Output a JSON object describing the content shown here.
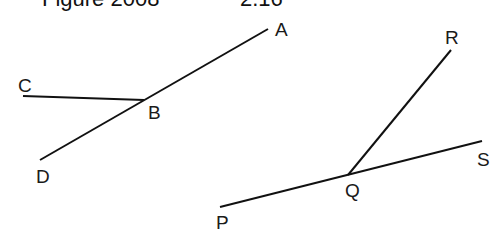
{
  "header": {
    "title_left": "Figure 2008",
    "title_right": "2.16"
  },
  "figure_left": {
    "points": {
      "A": {
        "label": "A",
        "x": 268,
        "y": 29
      },
      "B": {
        "label": "B",
        "x": 144,
        "y": 100
      },
      "C": {
        "label": "C",
        "x": 23,
        "y": 96
      },
      "D": {
        "label": "D",
        "x": 40,
        "y": 160
      }
    },
    "segments": [
      [
        "C",
        "B"
      ],
      [
        "D",
        "A"
      ]
    ]
  },
  "figure_right": {
    "points": {
      "P": {
        "label": "P",
        "x": 220,
        "y": 207
      },
      "Q": {
        "label": "Q",
        "x": 348,
        "y": 175
      },
      "R": {
        "label": "R",
        "x": 451,
        "y": 50
      },
      "S": {
        "label": "S",
        "x": 482,
        "y": 141
      }
    },
    "segments": [
      [
        "P",
        "S"
      ],
      [
        "Q",
        "R"
      ]
    ]
  },
  "colors": {
    "line": "#111111",
    "background": "#ffffff"
  }
}
